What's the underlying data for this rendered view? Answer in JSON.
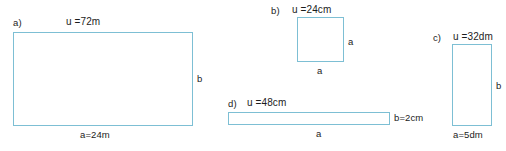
{
  "figures": [
    {
      "tag": "a)",
      "perimeter_label": "u =72m",
      "right_label": "b",
      "bottom_label": "a=24m",
      "shape": "rectangle"
    },
    {
      "tag": "b)",
      "perimeter_label": "u =24cm",
      "right_label": "a",
      "bottom_label": "a",
      "shape": "square"
    },
    {
      "tag": "c)",
      "perimeter_label": "u =32dm",
      "right_label": "b",
      "bottom_label": "a=5dm",
      "shape": "rectangle"
    },
    {
      "tag": "d)",
      "perimeter_label": "u =48cm",
      "right_label": "b=2cm",
      "bottom_label": "a",
      "shape": "rectangle"
    }
  ],
  "style": {
    "stroke_color": "#7dbfd4",
    "text_color": "#1c1c1c",
    "background": "#ffffff"
  }
}
